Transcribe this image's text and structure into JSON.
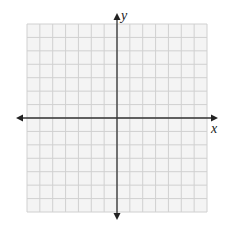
{
  "figure": {
    "type": "coordinate-plane",
    "x_axis_label": "x",
    "y_axis_label": "y",
    "grid_columns": 14,
    "grid_rows": 14,
    "columns_left_of_y_axis": 7,
    "columns_right_of_y_axis": 7,
    "rows_above_x_axis": 7,
    "rows_below_x_axis": 7,
    "arrows": [
      "left",
      "right",
      "up",
      "down"
    ]
  },
  "colors": {
    "background": "#ffffff",
    "grid_fill": "#f4f4f4",
    "grid_line": "#d0d0d0",
    "axis": "#333333",
    "label": "#222222"
  }
}
